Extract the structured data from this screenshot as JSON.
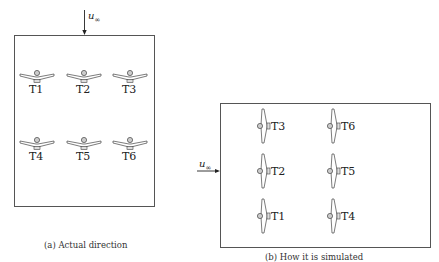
{
  "panel_a": {
    "flow_label": "u",
    "flow_subscript": "∞",
    "caption": "(a) Actual direction",
    "turbines": [
      {
        "label": "T1"
      },
      {
        "label": "T2"
      },
      {
        "label": "T3"
      },
      {
        "label": "T4"
      },
      {
        "label": "T5"
      },
      {
        "label": "T6"
      }
    ]
  },
  "panel_b": {
    "flow_label": "u",
    "flow_subscript": "∞",
    "caption": "(b) How it is simulated",
    "turbines": [
      {
        "label": "T3"
      },
      {
        "label": "T6"
      },
      {
        "label": "T2"
      },
      {
        "label": "T5"
      },
      {
        "label": "T1"
      },
      {
        "label": "T4"
      }
    ]
  },
  "icons": {
    "turbine": "wind-turbine-icon",
    "arrow": "flow-arrow-icon"
  }
}
